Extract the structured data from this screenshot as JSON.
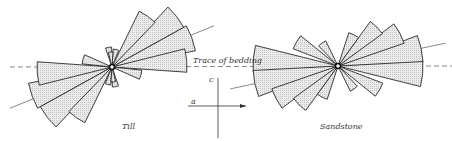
{
  "labels": {
    "till": "Till",
    "sandstone": "Sandstone",
    "bedding": "Trace of bedding",
    "axis_a": "a",
    "axis_c": "c"
  },
  "colors": {
    "stroke": "#2a2a2a",
    "fill": "#e4e4e4",
    "line": "#555555"
  },
  "chart_data": [
    {
      "type": "rose",
      "title": "Till",
      "center": [
        112,
        67
      ],
      "petals_deg_from_east_ccw": [
        {
          "dir": 5,
          "len": 75
        },
        {
          "dir": 20,
          "len": 85
        },
        {
          "dir": 38,
          "len": 82
        },
        {
          "dir": 55,
          "len": 62
        },
        {
          "dir": 77,
          "len": 18
        },
        {
          "dir": 95,
          "len": 15
        },
        {
          "dir": -15,
          "len": 30
        },
        {
          "dir": -80,
          "len": 20
        }
      ],
      "note": "Symmetric rose diagram; petals mirrored through center"
    },
    {
      "type": "rose",
      "title": "Sandstone",
      "center": [
        338,
        66
      ],
      "petals_deg_from_east_ccw": [
        {
          "dir": -5,
          "len": 85
        },
        {
          "dir": 12,
          "len": 85
        },
        {
          "dir": 28,
          "len": 70
        },
        {
          "dir": 45,
          "len": 55
        },
        {
          "dir": 63,
          "len": 35
        },
        {
          "dir": -30,
          "len": 48
        },
        {
          "dir": -55,
          "len": 28
        }
      ],
      "note": "Symmetric rose diagram; petals mirrored through center"
    }
  ]
}
